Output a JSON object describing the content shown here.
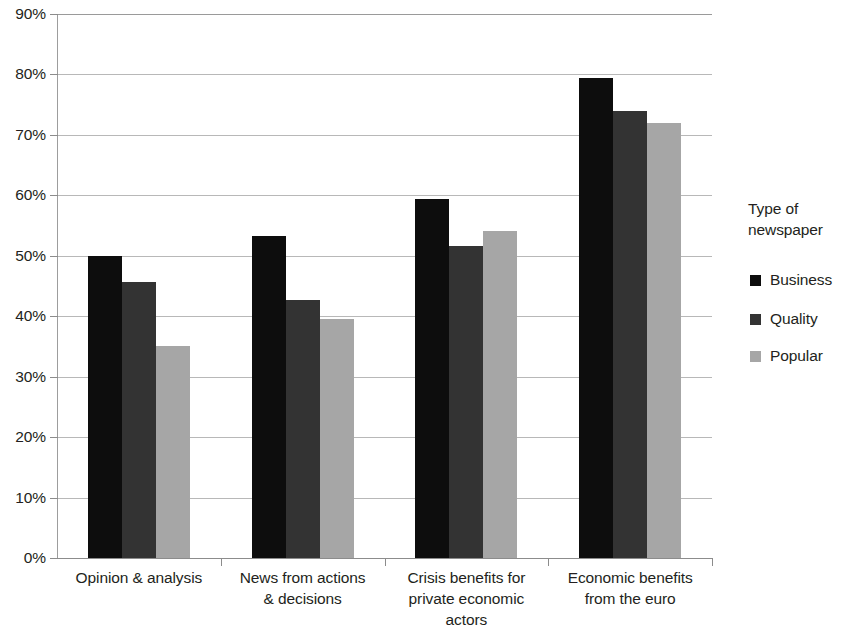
{
  "chart_data": {
    "type": "bar",
    "title": "",
    "xlabel": "",
    "ylabel": "",
    "ylim": [
      0,
      90
    ],
    "grid": true,
    "legend_position": "right",
    "categories": [
      "Opinion & analysis",
      "News from actions\n& decisions",
      "Crisis benefits for\nprivate economic\nactors",
      "Economic benefits\nfrom the euro"
    ],
    "ytick_labels": [
      "90%",
      "80%",
      "70%",
      "60%",
      "50%",
      "40%",
      "30%",
      "20%",
      "10%",
      "0%"
    ],
    "ytick_values": [
      90,
      80,
      70,
      60,
      50,
      40,
      30,
      20,
      10,
      0
    ],
    "series": [
      {
        "name": "Business",
        "color": "#0d0d0d",
        "values": [
          50.0,
          53.3,
          59.4,
          79.4
        ]
      },
      {
        "name": "Quality",
        "color": "#333333",
        "values": [
          45.7,
          42.7,
          51.6,
          74.0
        ]
      },
      {
        "name": "Popular",
        "color": "#a6a6a6",
        "values": [
          35.0,
          39.5,
          54.1,
          71.9
        ]
      }
    ]
  },
  "legend": {
    "title": "Type of\nnewspaper",
    "entries": [
      {
        "label": "Business",
        "color": "#0d0d0d"
      },
      {
        "label": "Quality",
        "color": "#333333"
      },
      {
        "label": "Popular",
        "color": "#a6a6a6"
      }
    ]
  }
}
